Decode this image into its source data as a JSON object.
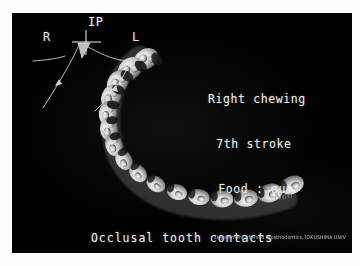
{
  "figure": {
    "background_color": "#ffffff",
    "plate_color": "#000000",
    "plate_text_color": "#eeeeee"
  },
  "incisal_path_diagram": {
    "apex_label": "IP",
    "right_label": "R",
    "left_label": "L",
    "cursor_icon": "triangle-pointer-icon",
    "crosshair_icon": "crosshair-icon",
    "arrow_left_icon": "arrowhead-icon",
    "arrow_right_icon": "arrowhead-icon",
    "trace_color": "#cfcfcf"
  },
  "annotation": {
    "line1": "Right chewing",
    "line2": "7th stroke",
    "line3": "Food : gum"
  },
  "caption": {
    "line1": "Occlusal tooth contacts",
    "line2": "<1mm to the intercuspal position on the incisal path>"
  },
  "credit": {
    "text": "Department of Fixed Prosthodontics,TOKUSHIMA UNIV"
  },
  "signature": {
    "text": "Nao"
  },
  "dental_arch": {
    "description": "occlusal-view tooth row forming a C-shaped arch",
    "tooth_count": 16,
    "highlight_color": "#f2f2f2",
    "shadow_color": "#2a2a2a"
  }
}
